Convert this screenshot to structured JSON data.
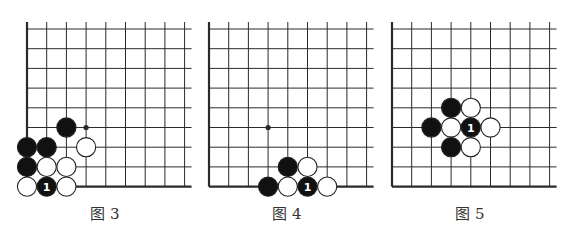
{
  "style": {
    "line_color": "#2a2a2a",
    "black_stone": "#111111",
    "white_stone": "#ffffff",
    "stone_outline": "#222222",
    "label_on_black": "#ffffff",
    "caption_color": "#333333"
  },
  "geometry": {
    "spacing": 19.7,
    "cols": 9,
    "rows": 9,
    "top_y": 29,
    "stone_radius": 9.6
  },
  "diagrams": [
    {
      "id": "fig3",
      "caption": "图 3",
      "origin_x": 27,
      "caption_x": 105,
      "dots": [
        {
          "col": 3,
          "row": 5
        }
      ],
      "stones": [
        {
          "col": 2,
          "row": 5,
          "color": "black"
        },
        {
          "col": 0,
          "row": 6,
          "color": "black"
        },
        {
          "col": 1,
          "row": 6,
          "color": "black"
        },
        {
          "col": 3,
          "row": 6,
          "color": "white"
        },
        {
          "col": 0,
          "row": 7,
          "color": "black"
        },
        {
          "col": 1,
          "row": 7,
          "color": "white"
        },
        {
          "col": 2,
          "row": 7,
          "color": "white"
        },
        {
          "col": 0,
          "row": 8,
          "color": "white"
        },
        {
          "col": 1,
          "row": 8,
          "color": "black",
          "label": "1"
        },
        {
          "col": 2,
          "row": 8,
          "color": "white"
        }
      ]
    },
    {
      "id": "fig4",
      "caption": "图 4",
      "origin_x": 209,
      "caption_x": 287,
      "dots": [
        {
          "col": 3,
          "row": 5
        }
      ],
      "stones": [
        {
          "col": 4,
          "row": 7,
          "color": "black"
        },
        {
          "col": 5,
          "row": 7,
          "color": "white"
        },
        {
          "col": 3,
          "row": 8,
          "color": "black"
        },
        {
          "col": 4,
          "row": 8,
          "color": "white"
        },
        {
          "col": 5,
          "row": 8,
          "color": "black",
          "label": "1"
        },
        {
          "col": 6,
          "row": 8,
          "color": "white"
        }
      ]
    },
    {
      "id": "fig5",
      "caption": "图 5",
      "origin_x": 392,
      "caption_x": 470,
      "dots": [],
      "stones": [
        {
          "col": 3,
          "row": 4,
          "color": "black"
        },
        {
          "col": 4,
          "row": 4,
          "color": "white"
        },
        {
          "col": 2,
          "row": 5,
          "color": "black"
        },
        {
          "col": 3,
          "row": 5,
          "color": "white"
        },
        {
          "col": 4,
          "row": 5,
          "color": "black",
          "label": "1"
        },
        {
          "col": 5,
          "row": 5,
          "color": "white"
        },
        {
          "col": 3,
          "row": 6,
          "color": "black"
        },
        {
          "col": 4,
          "row": 6,
          "color": "white"
        }
      ]
    }
  ]
}
